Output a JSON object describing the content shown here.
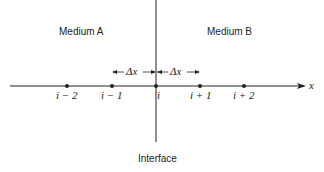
{
  "media": {
    "left": "Medium A",
    "right": "Medium B"
  },
  "interface_label": "Interface",
  "axis_label": "x",
  "spacing_label": "Δx",
  "nodes": [
    {
      "label": "i − 2",
      "x": 67
    },
    {
      "label": "i − 1",
      "x": 112
    },
    {
      "label": "i",
      "x": 156
    },
    {
      "label": "i + 1",
      "x": 200
    },
    {
      "label": "i + 2",
      "x": 244
    }
  ],
  "colors": {
    "line": "#222222",
    "background": "#ffffff"
  }
}
